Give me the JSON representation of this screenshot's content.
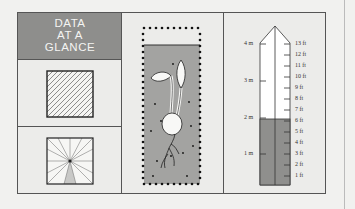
{
  "title": {
    "lines": [
      "DATA",
      "AT A",
      "GLANCE"
    ]
  },
  "icons": {
    "hatch": "hatched-square-icon",
    "sunburst": "sunburst-square-icon",
    "seedling": "seedling-in-soil-icon",
    "ruler": "height-ruler-icon"
  },
  "ruler": {
    "metric_labels": [
      "4 m",
      "3 m",
      "2 m",
      "1 m"
    ],
    "imperial_labels": [
      "13 ft",
      "12 ft",
      "11 ft",
      "10 ft",
      "9 ft",
      "8 ft",
      "7 ft",
      "6 ft",
      "5 ft",
      "4 ft",
      "3 ft",
      "2 ft",
      "1 ft"
    ],
    "fill_level": "6 ft"
  },
  "colors": {
    "title_bg": "#8e8e8c",
    "soil": "#9e9e9c",
    "ruler_fill": "#8f8f8d",
    "frame": "#555555",
    "background": "#ececea"
  }
}
